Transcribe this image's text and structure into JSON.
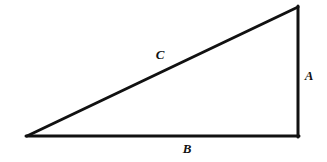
{
  "figure": {
    "kind": "right-triangle-diagram",
    "background_color": "#ffffff",
    "stroke_color": "#111111",
    "label_color": "#111111",
    "canvas": {
      "width": 327,
      "height": 162
    }
  },
  "geometry": {
    "vertices": {
      "left": {
        "x": 27,
        "y": 136
      },
      "apex": {
        "x": 298,
        "y": 7
      },
      "right_angle": {
        "x": 298,
        "y": 136
      }
    },
    "sides": [
      {
        "id": "A",
        "name": "vertical-leg",
        "from": "apex",
        "to": "right_angle",
        "stroke_width": 3
      },
      {
        "id": "B",
        "name": "horizontal-leg",
        "from": "left",
        "to": "right_angle",
        "stroke_width": 3
      },
      {
        "id": "C",
        "name": "hypotenuse",
        "from": "left",
        "to": "apex",
        "stroke_width": 3
      }
    ]
  },
  "labels": {
    "a": {
      "text": "A",
      "x": 309,
      "y": 75
    },
    "b": {
      "text": "B",
      "x": 187,
      "y": 148
    },
    "c": {
      "text": "C",
      "x": 160,
      "y": 54
    }
  }
}
